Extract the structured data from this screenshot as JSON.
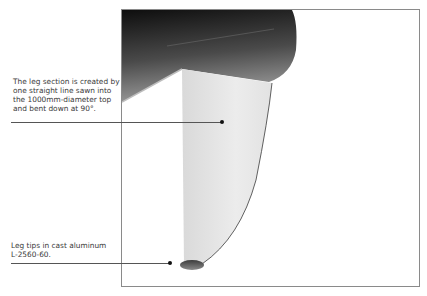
{
  "document": {
    "top_fragment": "",
    "figure": {
      "subject": "Round table, leg section detail",
      "frame_color": "#8a8a8a",
      "tabletop_color_dark": "#1a1a1a",
      "tabletop_color_light": "#8c8c8c",
      "leg_color": "#e4e4e4",
      "foot_color": "#6a6a6a"
    },
    "callouts": [
      {
        "text": "The leg section is created by\none straight line sawn into\nthe 1000mm-diameter top\nand bent down at 90°.",
        "target": "leg-section"
      },
      {
        "text": "Leg tips in cast aluminum\nL-2560-60.",
        "target": "leg-tip"
      }
    ]
  }
}
